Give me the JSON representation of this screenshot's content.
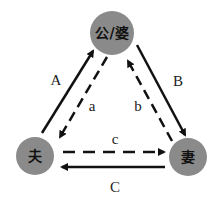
{
  "diagram": {
    "colors": {
      "node_fill": "#8a8a8a",
      "line": "#111111",
      "background": "#ffffff"
    },
    "nodes": {
      "top": {
        "label": "公/婆",
        "cx": 112,
        "cy": 33,
        "r": 22
      },
      "left": {
        "label": "夫",
        "cx": 35,
        "cy": 156,
        "r": 19
      },
      "right": {
        "label": "妻",
        "cx": 188,
        "cy": 157,
        "r": 19
      }
    },
    "edges": [
      {
        "label": "A",
        "from": "left",
        "to": "top",
        "style": "solid"
      },
      {
        "label": "a",
        "from": "top",
        "to": "left",
        "style": "dashed"
      },
      {
        "label": "B",
        "from": "top",
        "to": "right",
        "style": "solid"
      },
      {
        "label": "b",
        "from": "right",
        "to": "top",
        "style": "dashed"
      },
      {
        "label": "c",
        "from": "left",
        "to": "right",
        "style": "dashed"
      },
      {
        "label": "C",
        "from": "right",
        "to": "left",
        "style": "solid"
      }
    ]
  }
}
